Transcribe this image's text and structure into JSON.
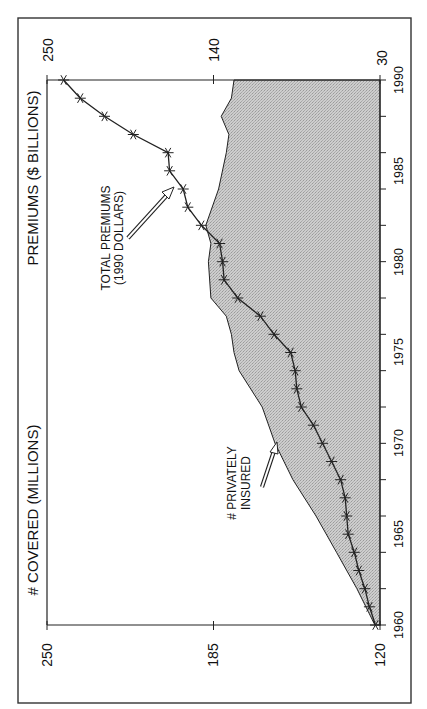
{
  "chart_data": {
    "type": "line",
    "orientation": "rotated 90 degrees clockwise (x-axis runs bottom-to-top along the right side)",
    "title": "",
    "xlabel": "Year",
    "x": [
      1960,
      1961,
      1962,
      1963,
      1964,
      1965,
      1966,
      1967,
      1968,
      1969,
      1970,
      1971,
      1972,
      1973,
      1974,
      1975,
      1976,
      1977,
      1978,
      1979,
      1980,
      1981,
      1982,
      1983,
      1984,
      1985,
      1986,
      1987,
      1988,
      1989,
      1990
    ],
    "x_ticks": [
      1960,
      1965,
      1970,
      1975,
      1980,
      1985,
      1990
    ],
    "xlim": [
      1960,
      1990
    ],
    "series": [
      {
        "name": "Total premiums (1990 dollars)",
        "axis": "PREMIUMS ($ BILLIONS)",
        "style": "line with asterisk markers",
        "values": [
          33,
          37,
          40,
          44,
          47,
          51,
          52,
          53,
          56,
          62,
          68,
          74,
          82,
          85,
          86,
          89,
          100,
          109,
          124,
          133,
          134,
          136,
          148,
          157,
          160,
          169,
          170,
          193,
          212,
          228,
          239
        ]
      },
      {
        "name": "# privately insured",
        "axis": "# COVERED (MILLIONS)",
        "style": "shaded area",
        "x": [
          1960,
          1962,
          1964,
          1966,
          1968,
          1970,
          1972,
          1974,
          1975,
          1976,
          1977,
          1978,
          1980,
          1981,
          1982,
          1984,
          1986,
          1987,
          1988,
          1989,
          1990
        ],
        "values": [
          122,
          129,
          137,
          145,
          154,
          161,
          166,
          175,
          177,
          178,
          180,
          186,
          187,
          186,
          188,
          183,
          180,
          179,
          182,
          178,
          177
        ]
      }
    ],
    "y_axes": [
      {
        "label": "# COVERED (MILLIONS)",
        "ticks": [
          120,
          185,
          250
        ],
        "ylim": [
          120,
          250
        ]
      },
      {
        "label": "PREMIUMS ($ BILLIONS)",
        "ticks": [
          30,
          140,
          250
        ],
        "ylim": [
          30,
          250
        ]
      }
    ],
    "annotations": [
      {
        "text": [
          "TOTAL PREMIUMS",
          "(1990 DOLLARS)"
        ],
        "points_to": "premium line near 1983"
      },
      {
        "text": [
          "# PRIVATELY",
          "INSURED"
        ],
        "points_to": "area boundary near 1970"
      }
    ],
    "grid": false,
    "legend": "none (inline annotations)"
  },
  "labels": {
    "covered_axis_title": "# COVERED (MILLIONS)",
    "premium_axis_title": "PREMIUMS ($ BILLIONS)",
    "covered_ticks": [
      "250",
      "185",
      "120"
    ],
    "premium_ticks": [
      "250",
      "140",
      "30"
    ],
    "year_ticks": [
      "1960",
      "1965",
      "1970",
      "1975",
      "1980",
      "1985",
      "1990"
    ],
    "premium_note_1": "TOTAL PREMIUMS",
    "premium_note_2": "(1990 DOLLARS)",
    "insured_note_1": "# PRIVATELY",
    "insured_note_2": "INSURED"
  },
  "colors": {
    "area_fill": "#c6c6c6",
    "line": "#222222",
    "frame": "#333333"
  }
}
